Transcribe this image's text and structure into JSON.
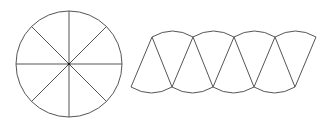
{
  "diagram": {
    "title": "",
    "circle": {
      "sectors": 8
    },
    "rearranged": {
      "sectors": 8,
      "arrangement": "alternating up/down"
    },
    "colors": {
      "stroke": "#555555",
      "background": "#ffffff"
    }
  }
}
